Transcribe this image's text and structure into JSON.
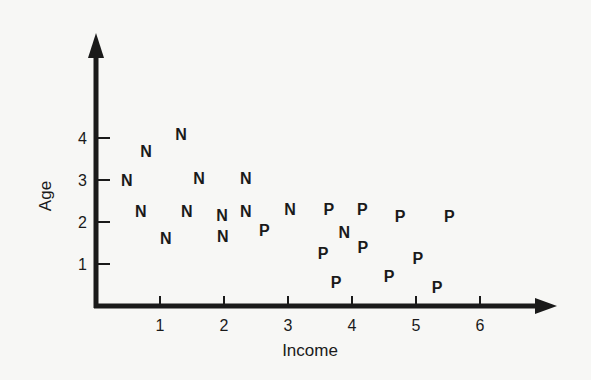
{
  "chart_data": {
    "type": "scatter",
    "title": "",
    "xlabel": "Income",
    "ylabel": "Age",
    "xlim": [
      0,
      7
    ],
    "ylim": [
      0,
      5
    ],
    "xticks": [
      1,
      2,
      3,
      4,
      5,
      6
    ],
    "yticks": [
      1,
      2,
      3,
      4
    ],
    "grid": false,
    "legend": null,
    "marker_style": "letter labels",
    "series": [
      {
        "name": "N",
        "points": [
          {
            "x": 1.33,
            "y": 4.1
          },
          {
            "x": 0.78,
            "y": 3.7
          },
          {
            "x": 0.48,
            "y": 3.0
          },
          {
            "x": 1.61,
            "y": 3.05
          },
          {
            "x": 2.34,
            "y": 3.05
          },
          {
            "x": 0.7,
            "y": 2.26
          },
          {
            "x": 1.42,
            "y": 2.26
          },
          {
            "x": 1.97,
            "y": 2.17
          },
          {
            "x": 2.34,
            "y": 2.26
          },
          {
            "x": 1.09,
            "y": 1.62
          },
          {
            "x": 1.98,
            "y": 1.67
          },
          {
            "x": 3.03,
            "y": 2.31
          },
          {
            "x": 3.88,
            "y": 1.76
          }
        ]
      },
      {
        "name": "P",
        "points": [
          {
            "x": 2.63,
            "y": 1.81
          },
          {
            "x": 3.64,
            "y": 2.31
          },
          {
            "x": 4.16,
            "y": 2.31
          },
          {
            "x": 4.75,
            "y": 2.14
          },
          {
            "x": 5.52,
            "y": 2.14
          },
          {
            "x": 3.55,
            "y": 1.26
          },
          {
            "x": 4.17,
            "y": 1.4
          },
          {
            "x": 5.03,
            "y": 1.14
          },
          {
            "x": 3.75,
            "y": 0.57
          },
          {
            "x": 4.58,
            "y": 0.71
          },
          {
            "x": 5.33,
            "y": 0.45
          }
        ]
      }
    ]
  },
  "colors": {
    "background": "#f7f7f5",
    "ink": "#1a1a1a"
  }
}
